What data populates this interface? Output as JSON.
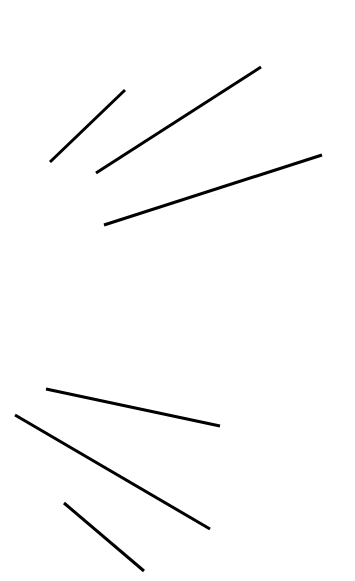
{
  "canvas": {
    "width": 355,
    "height": 581,
    "background": "#ffffff"
  },
  "stroke": {
    "color": "#000000",
    "width": 3
  },
  "groups": [
    {
      "name": "upper-fan",
      "lines": [
        {
          "x1": 50,
          "y1": 162,
          "x2": 125,
          "y2": 90
        },
        {
          "x1": 96,
          "y1": 173,
          "x2": 261,
          "y2": 67
        },
        {
          "x1": 104,
          "y1": 225,
          "x2": 322,
          "y2": 155
        }
      ]
    },
    {
      "name": "lower-fan",
      "lines": [
        {
          "x1": 46,
          "y1": 389,
          "x2": 220,
          "y2": 426
        },
        {
          "x1": 15,
          "y1": 415,
          "x2": 210,
          "y2": 529
        },
        {
          "x1": 64,
          "y1": 503,
          "x2": 144,
          "y2": 571
        }
      ]
    }
  ]
}
